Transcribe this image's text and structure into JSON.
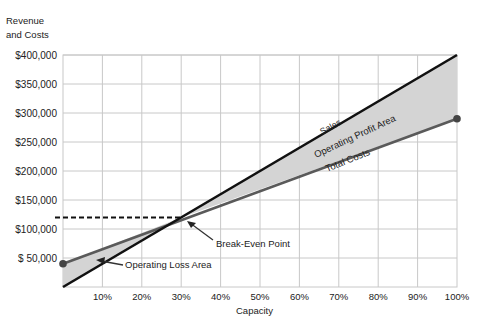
{
  "chart_data": {
    "type": "line",
    "title": "",
    "ylabel": "Revenue and Costs",
    "ylabel_lines": [
      "Revenue",
      "and Costs"
    ],
    "xlabel": "Capacity",
    "x": [
      0,
      10,
      20,
      30,
      40,
      50,
      60,
      70,
      80,
      90,
      100
    ],
    "xlim": [
      0,
      100
    ],
    "ylim": [
      0,
      400000
    ],
    "x_tick_labels": [
      "10%",
      "20%",
      "30%",
      "40%",
      "50%",
      "60%",
      "70%",
      "80%",
      "90%",
      "100%"
    ],
    "y_tick_labels": [
      "$400,000",
      "$350,000",
      "$300,000",
      "$250,000",
      "$200,000",
      "$150,000",
      "$100,000",
      "$ 50,000"
    ],
    "y_tick_values": [
      400000,
      350000,
      300000,
      250000,
      200000,
      150000,
      100000,
      50000
    ],
    "grid": true,
    "series": [
      {
        "name": "Sales",
        "x": [
          0,
          100
        ],
        "values": [
          0,
          400000
        ],
        "color": "#111111"
      },
      {
        "name": "Total Costs",
        "x": [
          0,
          100
        ],
        "values": [
          40000,
          290000
        ],
        "color": "#555555"
      }
    ],
    "break_even": {
      "x": 30,
      "y": 120000,
      "label": "Break-Even Point"
    },
    "annotations": [
      {
        "text": "Sales",
        "near": "sales line, ~65%"
      },
      {
        "text": "Operating Profit Area",
        "region": "between Sales and Total Costs, 30%–100%"
      },
      {
        "text": "Total Costs",
        "near": "total costs line, ~75%"
      },
      {
        "text": "Operating Loss Area",
        "region": "between Total Costs and Sales, 0%–30%"
      },
      {
        "text": "Break-Even Point",
        "at": [
          30,
          120000
        ]
      }
    ],
    "legend": null
  },
  "labels": {
    "ylabel_line1": "Revenue",
    "ylabel_line2": "and Costs",
    "xlabel": "Capacity",
    "sales": "Sales",
    "total_costs": "Total Costs",
    "profit_area": "Operating Profit Area",
    "loss_area": "Operating Loss Area",
    "break_even": "Break-Even Point"
  },
  "colors": {
    "sales": "#111111",
    "total_costs": "#5a5a5a",
    "shade": "#d4d4d4",
    "grid": "#c8c8c8",
    "marker": "#444444"
  }
}
